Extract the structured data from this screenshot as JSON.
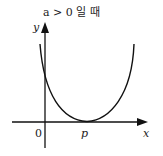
{
  "title": "a > 0 일 때",
  "axes": {
    "x_label": "x",
    "y_label": "y",
    "origin_label": "0"
  },
  "curve": {
    "type": "parabola",
    "vertex_label": "p",
    "description": "Upward-opening parabola tangent to the x-axis at x = p, crossing the y-axis above the origin"
  },
  "colors": {
    "stroke": "#111111",
    "text": "#222222",
    "background": "#ffffff"
  }
}
